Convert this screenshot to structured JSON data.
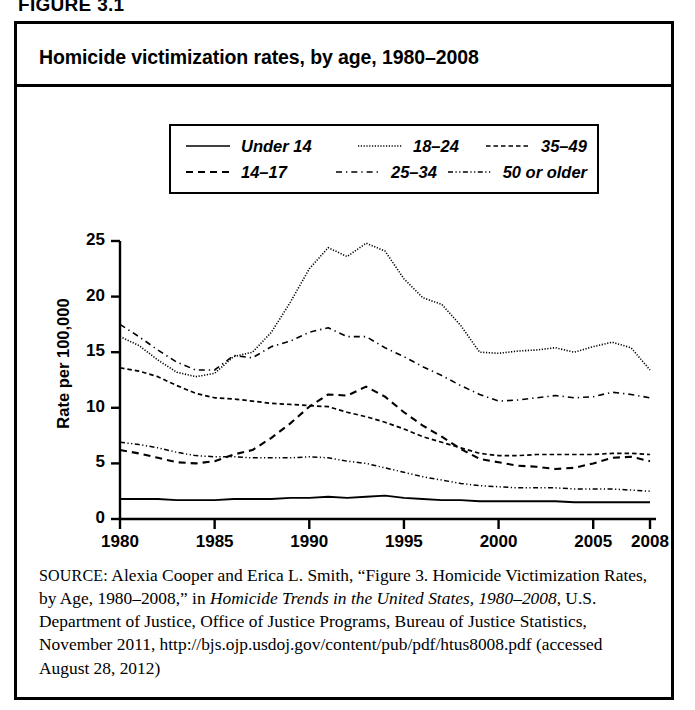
{
  "figure_label": "FIGURE 3.1",
  "chart_title": "Homicide victimization rates, by age, 1980–2008",
  "axes": {
    "ylabel": "Rate per 100,000",
    "yticks": [
      "0",
      "5",
      "10",
      "15",
      "20",
      "25"
    ],
    "xticks": [
      "1980",
      "1985",
      "1990",
      "1995",
      "2000",
      "2005",
      "2008"
    ]
  },
  "legend": {
    "rows": [
      [
        {
          "label": "Under 14",
          "style": "solid",
          "swatch": "line-solid-icon"
        },
        {
          "label": "18–24",
          "style": "dotted",
          "swatch": "line-dotted-icon"
        },
        {
          "label": "35–49",
          "style": "dashed-short",
          "swatch": "line-dashed-short-icon"
        }
      ],
      [
        {
          "label": "14–17",
          "style": "dashed-long",
          "swatch": "line-dashed-long-icon"
        },
        {
          "label": "25–34",
          "style": "dash-dot",
          "swatch": "line-dash-dot-icon"
        },
        {
          "label": "50 or older",
          "style": "dash-dot-dot",
          "swatch": "line-dash-dot-dot-icon"
        }
      ]
    ]
  },
  "source": {
    "prefix": "SOURCE:",
    "text_1": " Alexia Cooper and Erica L. Smith, “Figure 3. Homicide Victimization Rates, by Age, 1980–2008,” in ",
    "italic_1": "Homicide Trends in the United States, 1980–2008",
    "text_2": ", U.S. Department of Justice, Office of Justice Programs, Bureau of Justice Statistics, November 2011, http://bjs.ojp.usdoj.gov/content/pub/pdf/htus8008.pdf (accessed August 28, 2012)"
  },
  "chart_data": {
    "type": "line",
    "title": "Homicide victimization rates, by age, 1980–2008",
    "xlabel": "",
    "ylabel": "Rate per 100,000",
    "xlim": [
      1980,
      2008
    ],
    "ylim": [
      0,
      25
    ],
    "grid": false,
    "legend_position": "upper-center",
    "x": [
      1980,
      1981,
      1982,
      1983,
      1984,
      1985,
      1986,
      1987,
      1988,
      1989,
      1990,
      1991,
      1992,
      1993,
      1994,
      1995,
      1996,
      1997,
      1998,
      1999,
      2000,
      2001,
      2002,
      2003,
      2004,
      2005,
      2006,
      2007,
      2008
    ],
    "series": [
      {
        "name": "Under 14",
        "style": "solid",
        "values": [
          1.8,
          1.8,
          1.8,
          1.7,
          1.7,
          1.7,
          1.8,
          1.8,
          1.8,
          1.9,
          1.9,
          2.0,
          1.9,
          2.0,
          2.1,
          1.9,
          1.8,
          1.7,
          1.7,
          1.6,
          1.6,
          1.6,
          1.6,
          1.6,
          1.5,
          1.5,
          1.5,
          1.5,
          1.5
        ]
      },
      {
        "name": "14–17",
        "style": "dashed-long",
        "values": [
          6.2,
          5.9,
          5.5,
          5.1,
          5.0,
          5.2,
          5.8,
          6.2,
          7.3,
          8.6,
          10.1,
          11.2,
          11.1,
          11.9,
          11.0,
          9.6,
          8.4,
          7.4,
          6.3,
          5.4,
          5.1,
          4.8,
          4.7,
          4.5,
          4.6,
          5.0,
          5.5,
          5.6,
          5.2
        ]
      },
      {
        "name": "18–24",
        "style": "dotted",
        "values": [
          16.4,
          15.6,
          14.3,
          13.2,
          12.8,
          13.1,
          14.6,
          15.0,
          16.8,
          19.5,
          22.5,
          24.4,
          23.6,
          24.8,
          24.1,
          21.6,
          19.9,
          19.3,
          17.4,
          15.0,
          14.9,
          15.1,
          15.2,
          15.4,
          15.0,
          15.5,
          15.9,
          15.4,
          13.4
        ]
      },
      {
        "name": "25–34",
        "style": "dash-dot",
        "values": [
          17.5,
          16.4,
          15.2,
          14.1,
          13.4,
          13.4,
          14.7,
          14.5,
          15.5,
          16.0,
          16.8,
          17.2,
          16.4,
          16.4,
          15.4,
          14.6,
          13.7,
          12.9,
          12.0,
          11.2,
          10.6,
          10.7,
          10.9,
          11.1,
          10.9,
          11.0,
          11.4,
          11.2,
          10.9
        ]
      },
      {
        "name": "35–49",
        "style": "dashed-short",
        "values": [
          13.6,
          13.3,
          12.8,
          12.0,
          11.3,
          10.9,
          10.8,
          10.6,
          10.4,
          10.3,
          10.2,
          10.1,
          9.6,
          9.2,
          8.7,
          8.1,
          7.4,
          6.9,
          6.4,
          5.9,
          5.7,
          5.7,
          5.8,
          5.8,
          5.8,
          5.8,
          5.9,
          5.9,
          5.8
        ]
      },
      {
        "name": "50 or older",
        "style": "dash-dot-dot",
        "values": [
          6.9,
          6.7,
          6.4,
          6.0,
          5.7,
          5.6,
          5.6,
          5.5,
          5.5,
          5.5,
          5.6,
          5.5,
          5.2,
          5.0,
          4.6,
          4.2,
          3.8,
          3.5,
          3.2,
          3.0,
          2.9,
          2.8,
          2.8,
          2.8,
          2.7,
          2.7,
          2.7,
          2.6,
          2.5
        ]
      }
    ]
  }
}
